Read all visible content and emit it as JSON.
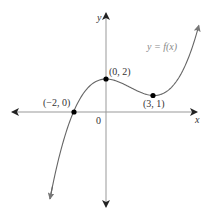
{
  "chart_data": {
    "type": "line",
    "title": "",
    "xlabel": "x",
    "ylabel": "y",
    "function_label": "y = f(x)",
    "origin_label": "0",
    "series": [
      {
        "name": "y = f(x)",
        "description": "cubic curve with x-intercept at (-2, 0), local max at (0, 2), local min at (3, 1)",
        "x": [
          -3.5,
          -3,
          -2.5,
          -2,
          -1.5,
          -1,
          -0.5,
          0,
          0.5,
          1,
          1.5,
          2,
          2.5,
          3,
          3.5,
          4,
          4.5,
          5,
          5.5,
          5.8
        ],
        "y": [
          -5.26,
          -3.0,
          -1.24,
          0.0,
          0.98,
          1.59,
          1.91,
          2.0,
          1.93,
          1.74,
          1.5,
          1.26,
          1.08,
          1.0,
          1.09,
          1.41,
          1.99,
          2.93,
          4.25,
          5.26
        ]
      }
    ],
    "labeled_points": [
      {
        "label": "(−2, 0)",
        "x": -2,
        "y": 0
      },
      {
        "label": "(0, 2)",
        "x": 0,
        "y": 2
      },
      {
        "label": "(3, 1)",
        "x": 3,
        "y": 1
      }
    ],
    "xlim": [
      -5.8,
      5.7
    ],
    "ylim": [
      -5.8,
      6.3
    ],
    "grid": false,
    "legend": "none"
  }
}
